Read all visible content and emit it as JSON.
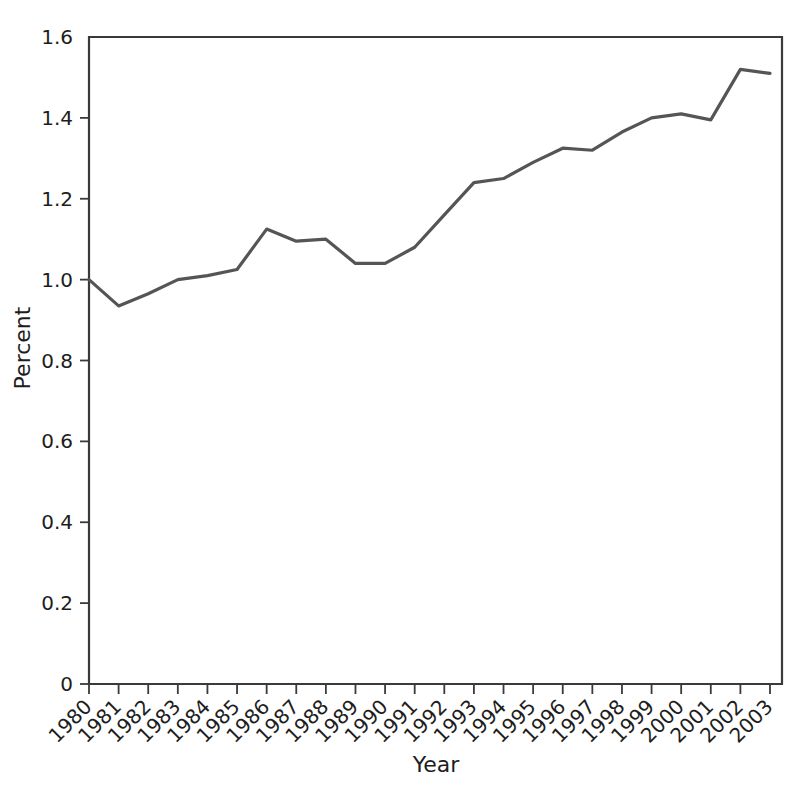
{
  "chart_data": {
    "type": "line",
    "title": "",
    "xlabel": "Year",
    "ylabel": "Percent",
    "categories": [
      "1980",
      "1981",
      "1982",
      "1983",
      "1984",
      "1985",
      "1986",
      "1987",
      "1988",
      "1989",
      "1990",
      "1991",
      "1992",
      "1993",
      "1994",
      "1995",
      "1996",
      "1997",
      "1998",
      "1999",
      "2000",
      "2001",
      "2002",
      "2003"
    ],
    "values": [
      1.0,
      0.935,
      0.965,
      1.0,
      1.01,
      1.025,
      1.125,
      1.095,
      1.1,
      1.04,
      1.04,
      1.08,
      1.16,
      1.24,
      1.25,
      1.29,
      1.325,
      1.32,
      1.365,
      1.4,
      1.41,
      1.395,
      1.52,
      1.51
    ],
    "series": [
      {
        "name": "Percent",
        "values": [
          1.0,
          0.935,
          0.965,
          1.0,
          1.01,
          1.025,
          1.125,
          1.095,
          1.1,
          1.04,
          1.04,
          1.08,
          1.16,
          1.24,
          1.25,
          1.29,
          1.325,
          1.32,
          1.365,
          1.4,
          1.41,
          1.395,
          1.52,
          1.51
        ]
      }
    ],
    "xlim": [
      1980,
      2003
    ],
    "ylim": [
      0,
      1.6
    ],
    "ytick_labels": [
      "0",
      "0.2",
      "0.4",
      "0.6",
      "0.8",
      "1.0",
      "1.2",
      "1.4",
      "1.6"
    ],
    "ytick_values": [
      0,
      0.2,
      0.4,
      0.6,
      0.8,
      1.0,
      1.2,
      1.4,
      1.6
    ],
    "xtick_labels": [
      "1980",
      "1981",
      "1982",
      "1983",
      "1984",
      "1985",
      "1986",
      "1987",
      "1988",
      "1989",
      "1990",
      "1991",
      "1992",
      "1993",
      "1994",
      "1995",
      "1996",
      "1997",
      "1998",
      "1999",
      "2000",
      "2001",
      "2002",
      "2003"
    ],
    "grid": false,
    "legend": false,
    "line_color": "#555555",
    "axis_color": "#3a3a3a",
    "background_color": "#ffffff",
    "xtick_label_rotation": -45
  }
}
